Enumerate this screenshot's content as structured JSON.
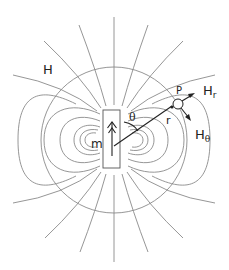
{
  "diagram": {
    "labels": {
      "field": "H",
      "moment": "m",
      "angle": "θ",
      "radius": "r",
      "point": "P",
      "radial_component": "H",
      "radial_sub": "r",
      "theta_component": "H",
      "theta_sub": "θ"
    },
    "colors": {
      "field_lines": "#8a8a8a",
      "ink": "#222222",
      "background": "#ffffff"
    }
  }
}
